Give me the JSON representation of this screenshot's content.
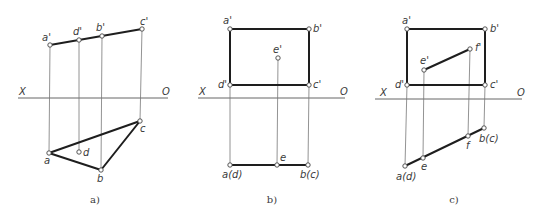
{
  "figure": {
    "colors": {
      "background": "#ffffff",
      "edge": "#1e1e1e",
      "projection": "#777777",
      "axis": "#555555",
      "text": "#3a3a3a"
    },
    "panels": [
      {
        "id": "a",
        "caption": "a)",
        "caption_pos": [
          95,
          203
        ],
        "axis": {
          "y": 98,
          "x1": 18,
          "x2": 168,
          "left_label": "X",
          "right_label": "O",
          "left_label_pos": [
            19,
            95
          ],
          "right_label_pos": [
            162,
            95
          ]
        },
        "points": [
          {
            "name": "a'",
            "x": 50,
            "y": 45,
            "lx": 42,
            "ly": 41
          },
          {
            "name": "d'",
            "x": 79,
            "y": 40,
            "lx": 73,
            "ly": 35
          },
          {
            "name": "b'",
            "x": 102,
            "y": 36,
            "lx": 96,
            "ly": 31
          },
          {
            "name": "c'",
            "x": 142,
            "y": 29,
            "lx": 140,
            "ly": 25
          },
          {
            "name": "c",
            "x": 140,
            "y": 121,
            "lx": 140,
            "ly": 132
          },
          {
            "name": "a",
            "x": 49,
            "y": 153,
            "lx": 44,
            "ly": 164
          },
          {
            "name": "d",
            "x": 79,
            "y": 152,
            "lx": 83,
            "ly": 156
          },
          {
            "name": "b",
            "x": 101,
            "y": 170,
            "lx": 97,
            "ly": 182
          }
        ],
        "edges": [
          [
            "a'",
            "c'"
          ],
          [
            "a",
            "b"
          ],
          [
            "b",
            "c"
          ],
          [
            "c",
            "a"
          ]
        ],
        "projectors": [
          [
            "a'",
            "a"
          ],
          [
            "d'",
            "d"
          ],
          [
            "b'",
            "b"
          ],
          [
            "c'",
            "c"
          ]
        ]
      },
      {
        "id": "b",
        "caption": "b)",
        "caption_pos": [
          272,
          203
        ],
        "axis": {
          "y": 98,
          "x1": 198,
          "x2": 345,
          "left_label": "X",
          "right_label": "O",
          "left_label_pos": [
            199,
            95
          ],
          "right_label_pos": [
            340,
            95
          ]
        },
        "points": [
          {
            "name": "a'",
            "x": 230,
            "y": 29,
            "lx": 223,
            "ly": 24
          },
          {
            "name": "b'",
            "x": 309,
            "y": 29,
            "lx": 313,
            "ly": 32
          },
          {
            "name": "e'",
            "x": 278,
            "y": 58,
            "lx": 273,
            "ly": 53
          },
          {
            "name": "d'",
            "x": 230,
            "y": 85,
            "lx": 218,
            "ly": 88
          },
          {
            "name": "c'",
            "x": 309,
            "y": 85,
            "lx": 313,
            "ly": 88
          },
          {
            "name": "a(d)",
            "x": 230,
            "y": 165,
            "lx": 222,
            "ly": 178
          },
          {
            "name": "e",
            "x": 277,
            "y": 165,
            "lx": 280,
            "ly": 161
          },
          {
            "name": "b(c)",
            "x": 308,
            "y": 165,
            "lx": 300,
            "ly": 178
          }
        ],
        "edges": [
          [
            "a'",
            "b'"
          ],
          [
            "b'",
            "c'"
          ],
          [
            "c'",
            "d'"
          ],
          [
            "d'",
            "a'"
          ],
          [
            "a(d)",
            "b(c)"
          ]
        ],
        "projectors": [
          [
            "d'",
            "a(d)"
          ],
          [
            "e'",
            "e"
          ],
          [
            "c'",
            "b(c)"
          ]
        ]
      },
      {
        "id": "c",
        "caption": "c)",
        "caption_pos": [
          454,
          203
        ],
        "axis": {
          "y": 99,
          "x1": 375,
          "x2": 522,
          "left_label": "X",
          "right_label": "O",
          "left_label_pos": [
            380,
            96
          ],
          "right_label_pos": [
            517,
            96
          ]
        },
        "points": [
          {
            "name": "a'",
            "x": 407,
            "y": 29,
            "lx": 402,
            "ly": 24
          },
          {
            "name": "b'",
            "x": 485,
            "y": 29,
            "lx": 490,
            "ly": 32
          },
          {
            "name": "f'",
            "x": 470,
            "y": 49,
            "lx": 475,
            "ly": 51
          },
          {
            "name": "e'",
            "x": 424,
            "y": 70,
            "lx": 420,
            "ly": 64
          },
          {
            "name": "d'",
            "x": 407,
            "y": 85,
            "lx": 395,
            "ly": 88
          },
          {
            "name": "c'",
            "x": 485,
            "y": 85,
            "lx": 490,
            "ly": 88
          },
          {
            "name": "b(c)",
            "x": 484,
            "y": 128,
            "lx": 479,
            "ly": 142
          },
          {
            "name": "f",
            "x": 468,
            "y": 136,
            "lx": 466,
            "ly": 149
          },
          {
            "name": "e",
            "x": 423,
            "y": 158,
            "lx": 421,
            "ly": 170
          },
          {
            "name": "a(d)",
            "x": 405,
            "y": 166,
            "lx": 396,
            "ly": 180
          }
        ],
        "edges": [
          [
            "a'",
            "b'"
          ],
          [
            "b'",
            "c'"
          ],
          [
            "c'",
            "d'"
          ],
          [
            "d'",
            "a'"
          ],
          [
            "e'",
            "f'"
          ],
          [
            "a(d)",
            "b(c)"
          ]
        ],
        "projectors": [
          [
            "d'",
            "a(d)"
          ],
          [
            "e'",
            "e"
          ],
          [
            "f'",
            "f"
          ],
          [
            "c'",
            "b(c)"
          ]
        ]
      }
    ]
  }
}
